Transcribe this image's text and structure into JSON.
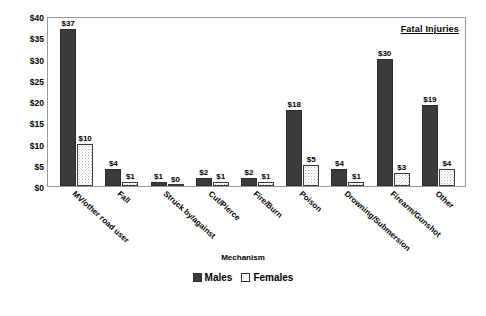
{
  "chart_data": {
    "type": "bar",
    "title": "Fatal Injuries",
    "xlabel": "Mechanism",
    "ylabel": "",
    "ylim": [
      0,
      40
    ],
    "yticks": [
      "$0",
      "$5",
      "$10",
      "$15",
      "$20",
      "$25",
      "$30",
      "$35",
      "$40"
    ],
    "ytick_values": [
      0,
      5,
      10,
      15,
      20,
      25,
      30,
      35,
      40
    ],
    "grid": false,
    "legend_position": "bottom",
    "value_prefix": "$",
    "categories": [
      "MV/other road user",
      "Fall",
      "Struck by/against",
      "Cut/Pierce",
      "Fire/Burn",
      "Poison",
      "Drowning/Submersion",
      "Firearm/Gunshot",
      "Other"
    ],
    "series": [
      {
        "name": "Males",
        "color": "#3b3b3b",
        "values": [
          37,
          4,
          1,
          2,
          2,
          18,
          4,
          30,
          19
        ],
        "labels": [
          "$37",
          "$4",
          "$1",
          "$2",
          "$2",
          "$18",
          "$4",
          "$30",
          "$19"
        ]
      },
      {
        "name": "Females",
        "color": "#ffffff",
        "values": [
          10,
          1,
          0,
          1,
          1,
          5,
          1,
          3,
          4
        ],
        "labels": [
          "$10",
          "$1",
          "$0",
          "$1",
          "$1",
          "$5",
          "$1",
          "$3",
          "$4"
        ]
      }
    ]
  }
}
